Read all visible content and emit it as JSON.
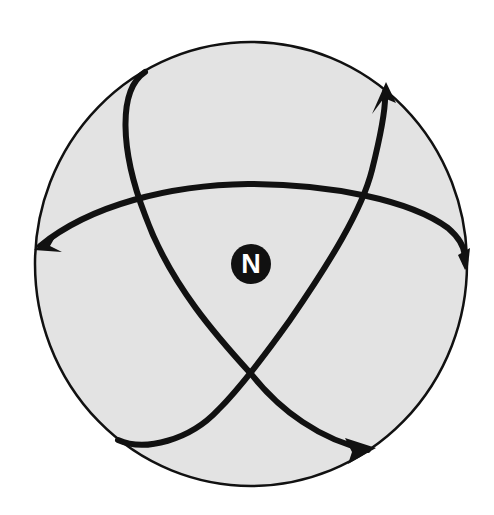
{
  "diagram": {
    "type": "sphere-with-curved-arrows",
    "center_label": "N",
    "colors": {
      "sphere_fill": "#e3e3e3",
      "stroke": "#111111",
      "badge_fill": "#111111",
      "badge_text": "#ffffff",
      "background": "#ffffff"
    },
    "curves": [
      {
        "name": "horizontal-arc",
        "arrow_ends": [
          "left",
          "right"
        ]
      },
      {
        "name": "left-lobe-arc",
        "arrow_ends": [
          "bottom-right"
        ]
      },
      {
        "name": "right-lobe-arc",
        "arrow_ends": [
          "top-right"
        ]
      }
    ]
  }
}
